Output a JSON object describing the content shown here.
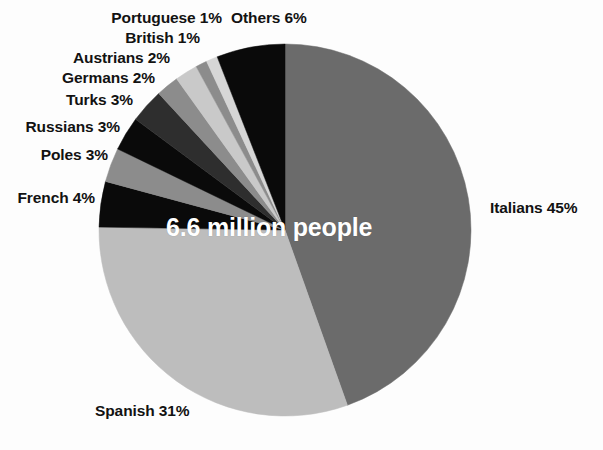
{
  "chart_data": {
    "type": "pie",
    "title": "",
    "center_label": "6.6 million people",
    "total_label": "6.6 million people",
    "legend_position": "callout-labels",
    "start_angle_deg": 0,
    "direction": "clockwise",
    "categories": [
      "Italians",
      "Spanish",
      "French",
      "Poles",
      "Russians",
      "Turks",
      "Germans",
      "Austrians",
      "British",
      "Portuguese",
      "Others"
    ],
    "values": [
      45,
      31,
      4,
      3,
      3,
      3,
      2,
      2,
      1,
      1,
      6
    ],
    "unit": "%",
    "slices": [
      {
        "name": "Italians",
        "value": 45,
        "label": "Italians 45%",
        "color": "#6b6b6b",
        "label_x": 490,
        "label_y": 200,
        "align": "left"
      },
      {
        "name": "Spanish",
        "value": 31,
        "label": "Spanish 31%",
        "color": "#bdbdbd",
        "label_x": 95,
        "label_y": 403,
        "align": "left"
      },
      {
        "name": "French",
        "value": 4,
        "label": "French 4%",
        "color": "#0a0a0a",
        "label_x": 95,
        "label_y": 190,
        "align": "right"
      },
      {
        "name": "Poles",
        "value": 3,
        "label": "Poles 3%",
        "color": "#8c8c8c",
        "label_x": 108,
        "label_y": 147,
        "align": "right"
      },
      {
        "name": "Russians",
        "value": 3,
        "label": "Russians 3%",
        "color": "#0a0a0a",
        "label_x": 120,
        "label_y": 119,
        "align": "right"
      },
      {
        "name": "Turks",
        "value": 3,
        "label": "Turks 3%",
        "color": "#2e2e2e",
        "label_x": 133,
        "label_y": 92,
        "align": "right"
      },
      {
        "name": "Germans",
        "value": 2,
        "label": "Germans 2%",
        "color": "#8c8c8c",
        "label_x": 155,
        "label_y": 70,
        "align": "right"
      },
      {
        "name": "Austrians",
        "value": 2,
        "label": "Austrians 2%",
        "color": "#c9c9c9",
        "label_x": 170,
        "label_y": 50,
        "align": "right"
      },
      {
        "name": "British",
        "value": 1,
        "label": "British 1%",
        "color": "#8c8c8c",
        "label_x": 200,
        "label_y": 30,
        "align": "right"
      },
      {
        "name": "Portuguese",
        "value": 1,
        "label": "Portuguese 1%",
        "color": "#d6d6d6",
        "label_x": 222,
        "label_y": 10,
        "align": "right"
      },
      {
        "name": "Others",
        "value": 6,
        "label": "Others 6%",
        "color": "#0a0a0a",
        "label_x": 231,
        "label_y": 10,
        "align": "left"
      }
    ],
    "geometry": {
      "cx": 285,
      "cy": 230,
      "r": 186
    },
    "background_color": "#fdfdfd",
    "center_text_color": "#ffffff"
  }
}
